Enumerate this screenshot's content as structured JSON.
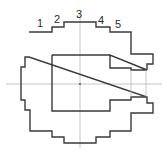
{
  "diagram": {
    "type": "stepped-profile-cross-section",
    "step_labels": [
      "1",
      "2",
      "3",
      "4",
      "5"
    ],
    "colors": {
      "outline": "#3a3a3a",
      "centerline": "#b0b0b0",
      "background": "#ffffff"
    }
  }
}
